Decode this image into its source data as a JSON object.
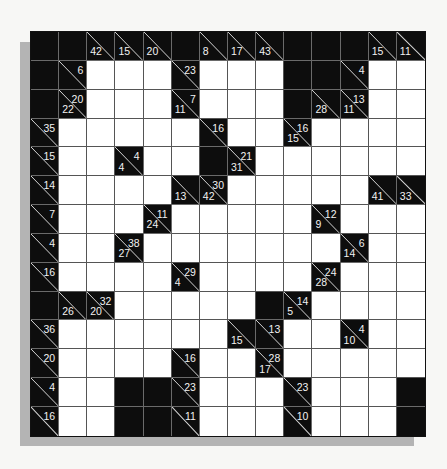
{
  "puzzle": {
    "type": "kakuro",
    "rows": 14,
    "cols": 14,
    "legend": {
      "B": "black-block",
      "W": "white-entry-cell",
      "clue": "[down_sum, across_sum] (null = absent)"
    },
    "colors": {
      "block": "#0d0d0d",
      "entry": "#ffffff",
      "clue_text": "#f2f2f2",
      "shadow": "#b4b4b4"
    },
    "grid": [
      [
        "B",
        "B",
        [
          42,
          null
        ],
        [
          15,
          null
        ],
        [
          20,
          null
        ],
        "B",
        [
          8,
          null
        ],
        [
          17,
          null
        ],
        [
          43,
          null
        ],
        "B",
        "B",
        "B",
        [
          15,
          null
        ],
        [
          11,
          null
        ]
      ],
      [
        "B",
        [
          null,
          6
        ],
        "W",
        "W",
        "W",
        [
          null,
          23
        ],
        "W",
        "W",
        "W",
        "B",
        "B",
        [
          null,
          4
        ],
        "W",
        "W"
      ],
      [
        "B",
        [
          22,
          20
        ],
        "W",
        "W",
        "W",
        [
          11,
          7
        ],
        "W",
        "W",
        "W",
        "B",
        [
          28,
          null
        ],
        [
          11,
          13
        ],
        "W",
        "W"
      ],
      [
        [
          null,
          35
        ],
        "W",
        "W",
        "W",
        "W",
        "W",
        [
          null,
          16
        ],
        "W",
        "W",
        [
          15,
          16
        ],
        "W",
        "W",
        "W",
        "W"
      ],
      [
        [
          null,
          15
        ],
        "W",
        "W",
        [
          4,
          4
        ],
        "W",
        "W",
        "B",
        [
          31,
          21
        ],
        "W",
        "W",
        "W",
        "W",
        "W",
        "W"
      ],
      [
        [
          null,
          14
        ],
        "W",
        "W",
        "W",
        "W",
        [
          13,
          null
        ],
        [
          42,
          30
        ],
        "W",
        "W",
        "W",
        "W",
        "W",
        [
          41,
          null
        ],
        [
          33,
          null
        ]
      ],
      [
        [
          null,
          7
        ],
        "W",
        "W",
        "W",
        [
          24,
          11
        ],
        "W",
        "W",
        "W",
        "W",
        "W",
        [
          9,
          12
        ],
        "W",
        "W",
        "W"
      ],
      [
        [
          null,
          4
        ],
        "W",
        "W",
        [
          27,
          38
        ],
        "W",
        "W",
        "W",
        "W",
        "W",
        "W",
        "W",
        [
          14,
          6
        ],
        "W",
        "W"
      ],
      [
        [
          null,
          16
        ],
        "W",
        "W",
        "W",
        "W",
        [
          4,
          29
        ],
        "W",
        "W",
        "W",
        "W",
        [
          28,
          24
        ],
        "W",
        "W",
        "W"
      ],
      [
        "B",
        [
          26,
          null
        ],
        [
          20,
          32
        ],
        "W",
        "W",
        "W",
        "W",
        "W",
        "B",
        [
          5,
          14
        ],
        "W",
        "W",
        "W",
        "W"
      ],
      [
        [
          null,
          36
        ],
        "W",
        "W",
        "W",
        "W",
        "W",
        "W",
        [
          15,
          null
        ],
        [
          null,
          13
        ],
        "W",
        "W",
        [
          10,
          4
        ],
        "W",
        "W"
      ],
      [
        [
          null,
          20
        ],
        "W",
        "W",
        "W",
        "W",
        [
          null,
          16
        ],
        "W",
        "W",
        [
          17,
          28
        ],
        "W",
        "W",
        "W",
        "W",
        "W"
      ],
      [
        [
          null,
          4
        ],
        "W",
        "W",
        "B",
        "B",
        [
          null,
          23
        ],
        "W",
        "W",
        "W",
        [
          null,
          23
        ],
        "W",
        "W",
        "W",
        "B"
      ],
      [
        [
          null,
          16
        ],
        "W",
        "W",
        "B",
        "B",
        [
          null,
          11
        ],
        "W",
        "W",
        "W",
        [
          null,
          10
        ],
        "W",
        "W",
        "W",
        "B"
      ]
    ]
  }
}
